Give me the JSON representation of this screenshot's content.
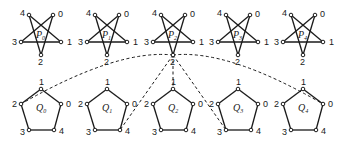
{
  "diagram": {
    "stars": [
      {
        "name": "P",
        "sub": "0",
        "cx": 41
      },
      {
        "name": "P",
        "sub": "1",
        "cx": 107
      },
      {
        "name": "P",
        "sub": "2",
        "cx": 173
      },
      {
        "name": "P",
        "sub": "3",
        "cx": 238
      },
      {
        "name": "P",
        "sub": "4",
        "cx": 303
      }
    ],
    "pentagons": [
      {
        "name": "Q",
        "sub": "0",
        "cx": 41
      },
      {
        "name": "Q",
        "sub": "1",
        "cx": 107
      },
      {
        "name": "Q",
        "sub": "2",
        "cx": 173
      },
      {
        "name": "Q",
        "sub": "3",
        "cx": 238
      },
      {
        "name": "Q",
        "sub": "4",
        "cx": 303
      }
    ],
    "vertex_labels": [
      "0",
      "1",
      "2",
      "3",
      "4"
    ],
    "star_edges": [
      [
        0,
        3
      ],
      [
        3,
        1
      ],
      [
        1,
        4
      ],
      [
        4,
        2
      ],
      [
        2,
        0
      ]
    ],
    "pentagon_edges": [
      [
        0,
        1
      ],
      [
        1,
        2
      ],
      [
        2,
        3
      ],
      [
        3,
        4
      ],
      [
        4,
        0
      ]
    ],
    "dashed_connections": {
      "from": {
        "graph": "P2",
        "vertex": "2"
      },
      "to": [
        {
          "graph": "Q0",
          "vertex": "2",
          "style": "arc"
        },
        {
          "graph": "Q1",
          "vertex": "4",
          "style": "line"
        },
        {
          "graph": "Q2",
          "vertex": "1",
          "style": "line"
        },
        {
          "graph": "Q3",
          "vertex": "3",
          "style": "line"
        },
        {
          "graph": "Q4",
          "vertex": "0",
          "style": "arc"
        }
      ]
    }
  }
}
